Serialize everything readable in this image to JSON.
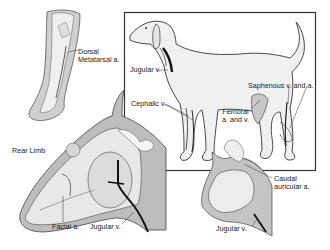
{
  "figure": {
    "panels": [
      {
        "id": "rear-limb",
        "caption": "Rear Limb"
      },
      {
        "id": "dog",
        "caption": ""
      },
      {
        "id": "horse-head",
        "caption": ""
      },
      {
        "id": "cow-head",
        "caption": ""
      }
    ],
    "labels": {
      "dorsal_metatarsal": "Dorsal\nMetatarsal a.",
      "rear_limb": "Rear Limb",
      "dog_jugular": "Jugular v.",
      "cephalic": "Cephalic v.",
      "femoral": "Femoral\na. and v.",
      "saphenous": "Saphenous v. and a.",
      "facial": "Facial a.",
      "horse_jugular": "Jugular v.",
      "caudal_auricular": "Caudal\nauricular a.",
      "cow_jugular": "Jugular v."
    },
    "colors": {
      "line": "#333333",
      "vessel": "#1a1a1a",
      "fill_light": "#eeeeee",
      "fill_mid": "#c8c8c8",
      "fill_dark": "#a9a9a9",
      "box": "#333333"
    }
  }
}
